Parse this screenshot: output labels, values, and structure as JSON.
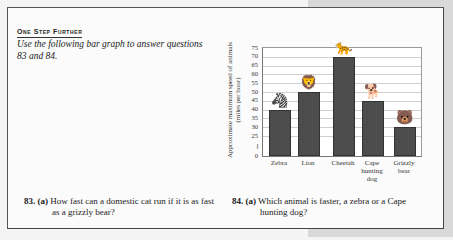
{
  "section": {
    "heading": "One Step Further",
    "intro": "Use the following bar graph to answer questions 83 and 84."
  },
  "questions": [
    {
      "number": "83.",
      "part": "(a)",
      "line1": "How fast can a domestic cat run if it is as fast",
      "line2": "as a grizzly bear?"
    },
    {
      "number": "84.",
      "part": "(a)",
      "line1": "Which animal is faster, a zebra or a Cape",
      "line2": "hunting dog?"
    }
  ],
  "chart_data": {
    "type": "bar",
    "title": "",
    "xlabel": "",
    "ylabel": "Approximate maximum speed of animals (miles per hour)",
    "categories": [
      "Zebra",
      "Lion",
      "Cheetah",
      "Cape hunting dog",
      "Grizzly bear"
    ],
    "category_labels": [
      [
        "Zebra"
      ],
      [
        "Lion"
      ],
      [
        "Cheetah"
      ],
      [
        "Cape",
        "hunting",
        "dog"
      ],
      [
        "Grizzly",
        "bear"
      ]
    ],
    "values": [
      40,
      50,
      70,
      45,
      30
    ],
    "yticks": [
      0,
      25,
      30,
      35,
      40,
      45,
      50,
      55,
      60,
      65,
      70,
      75
    ],
    "ylim": [
      0,
      75
    ],
    "axis_break": true,
    "grid": true,
    "bar_color": "#4d4d4d",
    "annotations": [
      "Animal illustrations standing atop each bar"
    ]
  }
}
